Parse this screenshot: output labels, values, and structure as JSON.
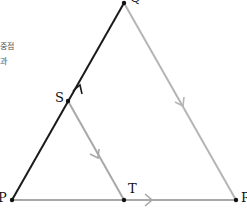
{
  "text_fragments": [
    {
      "id": "frag1",
      "text": "중점"
    },
    {
      "id": "frag2",
      "text": "과"
    }
  ],
  "points": {
    "P": {
      "label": "P",
      "x": 12,
      "y": 200
    },
    "Q": {
      "label": "Q",
      "x": 124,
      "y": 3
    },
    "R": {
      "label": "R",
      "x": 236,
      "y": 200
    },
    "S": {
      "label": "S",
      "x": 68,
      "y": 101
    },
    "T": {
      "label": "T",
      "x": 124,
      "y": 200
    }
  },
  "segments": [
    {
      "from": "P",
      "to": "Q",
      "color": "#1a1a1a",
      "arrow": true
    },
    {
      "from": "Q",
      "to": "R",
      "color": "#b5b5b5",
      "arrow": true
    },
    {
      "from": "S",
      "to": "T",
      "color": "#a8a8a8",
      "arrow": true
    },
    {
      "from": "P",
      "to": "R",
      "color": "#a8a8a8",
      "arrow": true
    }
  ],
  "colors": {
    "dark_line": "#1a1a1a",
    "light_line": "#b0b0b0",
    "point": "#111111"
  }
}
